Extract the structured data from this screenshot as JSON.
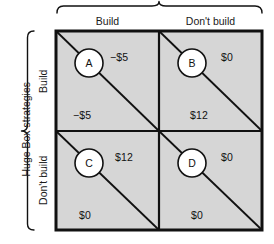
{
  "figure": {
    "row_group_label": "Huge Box strategies",
    "column_headers": [
      {
        "label": "Build"
      },
      {
        "label": "Don't build"
      }
    ],
    "row_headers": [
      {
        "label": "Build"
      },
      {
        "label": "Don't build"
      }
    ],
    "colors": {
      "cell_fill": "#d6d6d6",
      "circle_fill": "#ffffff",
      "line": "#111111",
      "text": "#1a1a1a",
      "background": "#ffffff"
    },
    "cells": [
      {
        "id": "A",
        "letter": "A",
        "row": "Build",
        "column": "Build",
        "upper_right_payoff": "−$5",
        "lower_left_payoff": "−$5"
      },
      {
        "id": "B",
        "letter": "B",
        "row": "Build",
        "column": "Don't build",
        "upper_right_payoff": "$0",
        "lower_left_payoff": "$12"
      },
      {
        "id": "C",
        "letter": "C",
        "row": "Don't build",
        "column": "Build",
        "upper_right_payoff": "$12",
        "lower_left_payoff": "$0"
      },
      {
        "id": "D",
        "letter": "D",
        "row": "Don't build",
        "column": "Don't build",
        "upper_right_payoff": "$0",
        "lower_left_payoff": "$0"
      }
    ]
  }
}
